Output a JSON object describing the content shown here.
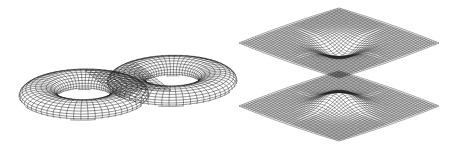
{
  "figure": {
    "panels": [
      {
        "id": "genus-two-surface",
        "description": "Wireframe double torus (genus-2 surface)",
        "mesh_color": "#1e1e1e"
      },
      {
        "id": "two-sheet-wormhole-surface",
        "description": "Wireframe of two parallel sheets joined by a narrow neck",
        "mesh_color": "#1e1e1e"
      }
    ],
    "background": "#ffffff"
  }
}
